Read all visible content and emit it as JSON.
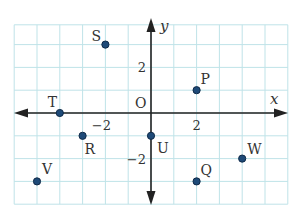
{
  "figure": {
    "type": "coordinate-plane",
    "x_axis_label": "x",
    "y_axis_label": "y",
    "origin_label": "O",
    "x_range": [
      -6,
      6
    ],
    "y_range": [
      -4,
      4
    ],
    "ticks": [
      {
        "axis": "x",
        "value": -2,
        "label": "−2"
      },
      {
        "axis": "x",
        "value": 2,
        "label": "2"
      },
      {
        "axis": "y",
        "value": 2,
        "label": "2"
      },
      {
        "axis": "y",
        "value": -2,
        "label": "−2"
      }
    ],
    "points": [
      {
        "name": "S",
        "x": -2,
        "y": 3
      },
      {
        "name": "P",
        "x": 2,
        "y": 1
      },
      {
        "name": "T",
        "x": -4,
        "y": 0
      },
      {
        "name": "R",
        "x": -3,
        "y": -1
      },
      {
        "name": "U",
        "x": 0,
        "y": -1
      },
      {
        "name": "W",
        "x": 4,
        "y": -2
      },
      {
        "name": "Q",
        "x": 2,
        "y": -3
      },
      {
        "name": "V",
        "x": -5,
        "y": -3
      }
    ],
    "colors": {
      "grid": "#bfe3e8",
      "axis": "#222222",
      "point_fill": "#1e4a78",
      "point_stroke": "#0f2a48",
      "text": "#333333"
    }
  }
}
